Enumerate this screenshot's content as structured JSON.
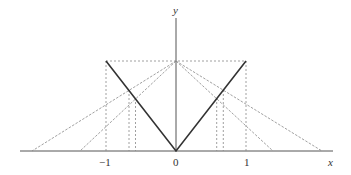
{
  "diagram": {
    "type": "geometric-construction",
    "function": "y = |x|",
    "axes": {
      "x_label": "x",
      "y_label": "y",
      "x_ticks": [
        {
          "value": -1,
          "label": "−1"
        },
        {
          "value": 0,
          "label": "0"
        },
        {
          "value": 1,
          "label": "1"
        }
      ]
    },
    "coordinate_mapping": {
      "origin_px": [
        176,
        151
      ],
      "x_unit_px": 70,
      "y_unit_px": 90
    },
    "solid_graph": {
      "name": "abs-value-v",
      "points": [
        [
          -1,
          1
        ],
        [
          0,
          0
        ],
        [
          1,
          1
        ]
      ]
    },
    "dashed_box": {
      "top_y": 1,
      "left_x": -1,
      "right_x": 1
    },
    "apex": [
      0,
      1
    ],
    "rays_from_apex": [
      {
        "x_intercept": -2.06,
        "meets_v_at_x": -0.673
      },
      {
        "x_intercept": -1.37,
        "meets_v_at_x": -0.578
      },
      {
        "x_intercept": 1.39,
        "meets_v_at_x": 0.582
      },
      {
        "x_intercept": 2.09,
        "meets_v_at_x": 0.676
      }
    ],
    "colors": {
      "axis": "#555555",
      "solid_graph": "#333333",
      "dashed": "#888888",
      "background": "#ffffff"
    }
  }
}
